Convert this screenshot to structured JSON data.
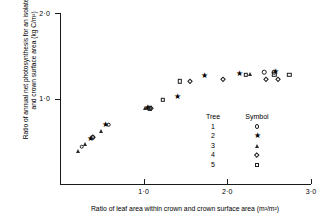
{
  "chart_data": {
    "type": "scatter",
    "title": "",
    "xlabel": "Ratio of leaf area within crown and crown surface area (m²/m²)",
    "ylabel": "Ratio of annual net photosynthesis for an isolated tree and crown surface area (kg C/m²)",
    "xlim": [
      0.0,
      3.0
    ],
    "ylim": [
      0.0,
      2.0
    ],
    "xticks": [
      1.0,
      2.0,
      3.0
    ],
    "xtick_labels": [
      "1·0",
      "2·0",
      "3·0"
    ],
    "yticks": [
      1.0,
      2.0
    ],
    "ytick_labels": [
      "1·0",
      "2·0"
    ],
    "grid": false,
    "legend_position": "inside-lower-right",
    "series": [
      {
        "name": "Tree 1",
        "symbol": "circle",
        "points": [
          {
            "x": 0.26,
            "y": 0.435
          },
          {
            "x": 0.39,
            "y": 0.545
          },
          {
            "x": 0.58,
            "y": 0.695
          },
          {
            "x": 1.06,
            "y": 0.885
          },
          {
            "x": 2.44,
            "y": 1.305
          },
          {
            "x": 2.56,
            "y": 1.305
          }
        ]
      },
      {
        "name": "Tree 2",
        "symbol": "star",
        "points": [
          {
            "x": 0.37,
            "y": 0.535
          },
          {
            "x": 0.54,
            "y": 0.7
          },
          {
            "x": 1.04,
            "y": 0.895
          },
          {
            "x": 1.41,
            "y": 1.035
          },
          {
            "x": 1.73,
            "y": 1.27
          },
          {
            "x": 2.15,
            "y": 1.3
          },
          {
            "x": 2.58,
            "y": 1.32
          }
        ]
      },
      {
        "name": "Tree 3",
        "symbol": "triangle",
        "points": [
          {
            "x": 0.21,
            "y": 0.385
          },
          {
            "x": 0.3,
            "y": 0.47
          },
          {
            "x": 0.49,
            "y": 0.62
          },
          {
            "x": 1.02,
            "y": 0.89
          },
          {
            "x": 2.27,
            "y": 1.29
          }
        ]
      },
      {
        "name": "Tree 4",
        "symbol": "diamond",
        "points": [
          {
            "x": 0.4,
            "y": 0.545
          },
          {
            "x": 1.09,
            "y": 0.885
          },
          {
            "x": 1.55,
            "y": 1.205
          },
          {
            "x": 1.95,
            "y": 1.23
          },
          {
            "x": 2.46,
            "y": 1.225
          },
          {
            "x": 2.6,
            "y": 1.23
          }
        ]
      },
      {
        "name": "Tree 5",
        "symbol": "square",
        "points": [
          {
            "x": 1.07,
            "y": 0.885
          },
          {
            "x": 1.23,
            "y": 0.985
          },
          {
            "x": 1.43,
            "y": 1.2
          },
          {
            "x": 2.22,
            "y": 1.275
          },
          {
            "x": 2.56,
            "y": 1.285
          },
          {
            "x": 2.74,
            "y": 1.275
          }
        ]
      }
    ]
  },
  "legend": {
    "header_tree": "Tree",
    "header_symbol": "Symbol",
    "rows": [
      {
        "tree": "1",
        "symbol": "circle"
      },
      {
        "tree": "2",
        "symbol": "star"
      },
      {
        "tree": "3",
        "symbol": "triangle"
      },
      {
        "tree": "4",
        "symbol": "diamond"
      },
      {
        "tree": "5",
        "symbol": "square"
      }
    ]
  }
}
